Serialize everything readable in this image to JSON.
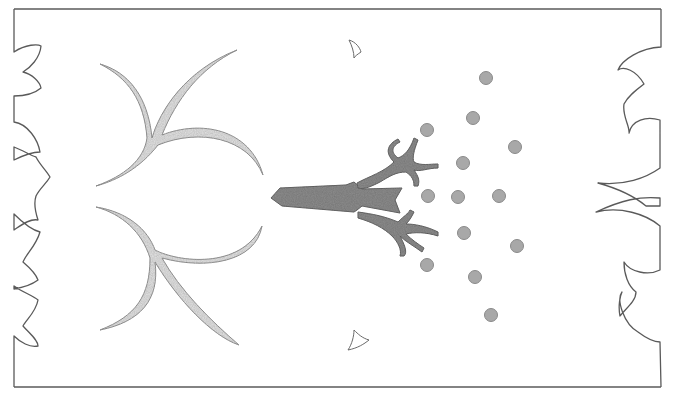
{
  "image": {
    "description": "Pencil sketch of a stylized border frame with a central tree trunk, branching roots, two horn-like curved branches on the left, two small crescents, and a scattered grid of grey dots",
    "colors": {
      "background": "#ffffff",
      "outline": "#5a5a5a",
      "trunk_fill": "#8e8e8e",
      "trunk_stroke": "#6a6a6a",
      "horn_fill": "#e4e4e4",
      "horn_stroke": "#9a9a9a",
      "dot_fill": "#a8a8a8",
      "dot_stroke": "#8a8a8a"
    },
    "frame": {
      "left": 14,
      "top": 9,
      "right": 661,
      "bottom": 387
    },
    "dots": [
      {
        "cx": 486,
        "cy": 78
      },
      {
        "cx": 473,
        "cy": 118
      },
      {
        "cx": 427,
        "cy": 130
      },
      {
        "cx": 515,
        "cy": 147
      },
      {
        "cx": 463,
        "cy": 163
      },
      {
        "cx": 428,
        "cy": 196
      },
      {
        "cx": 458,
        "cy": 197
      },
      {
        "cx": 499,
        "cy": 196
      },
      {
        "cx": 464,
        "cy": 233
      },
      {
        "cx": 517,
        "cy": 246
      },
      {
        "cx": 427,
        "cy": 265
      },
      {
        "cx": 475,
        "cy": 277
      },
      {
        "cx": 491,
        "cy": 315
      }
    ],
    "dot_radius": 6.5
  }
}
